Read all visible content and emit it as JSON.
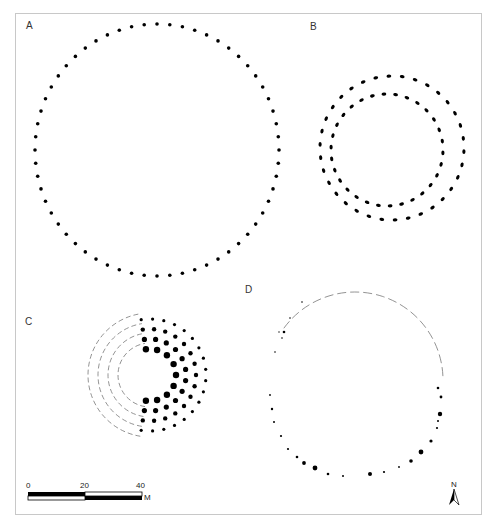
{
  "panels": [
    {
      "id": "A",
      "label": "A",
      "description": "single ring of posts, large circle",
      "cx": 157,
      "cy": 150,
      "r": 122,
      "posts": 60
    },
    {
      "id": "B",
      "label": "B",
      "description": "double concentric post ring",
      "outer": {
        "cx": 392,
        "cy": 148,
        "r": 72,
        "posts": 34
      },
      "inner": {
        "cx": 387,
        "cy": 150,
        "r": 56,
        "posts": 30
      }
    },
    {
      "id": "C",
      "label": "C",
      "description": "concentric rings of posts with dashed reconstructed western arcs",
      "cx": 150,
      "cy": 375,
      "rings": [
        20,
        30,
        40,
        50
      ]
    },
    {
      "id": "D",
      "label": "D",
      "description": "irregular ring of posts with dashed reconstructed northern arc",
      "cx": 355,
      "cy": 380
    }
  ],
  "scale_bar": {
    "ticks": [
      "0",
      "20",
      "40"
    ],
    "unit": "M"
  },
  "north_arrow": {
    "label": "N"
  },
  "colors": {
    "ink": "#000000",
    "frame": "#c8c8c8",
    "dash": "#777777"
  }
}
